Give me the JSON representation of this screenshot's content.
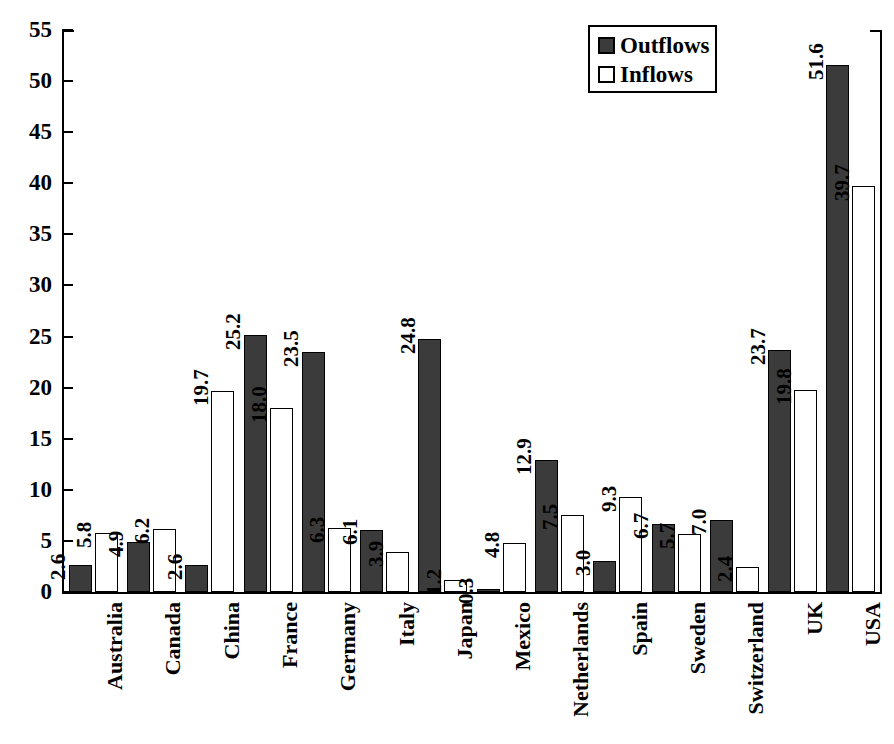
{
  "chart_data": {
    "type": "bar",
    "title": "",
    "subtitle": "",
    "xlabel": "",
    "ylabel": "",
    "ylim": [
      0,
      55
    ],
    "yticks": [
      0,
      5,
      10,
      15,
      20,
      25,
      30,
      35,
      40,
      45,
      50,
      55
    ],
    "ytick_labels": [
      "0",
      "5",
      "10",
      "15",
      "20",
      "25",
      "30",
      "35",
      "40",
      "45",
      "50",
      "55"
    ],
    "grid": false,
    "legend_position": "top-right",
    "categories": [
      "Australia",
      "Canada",
      "China",
      "France",
      "Germany",
      "Italy",
      "Japan",
      "Mexico",
      "Netherlands",
      "Spain",
      "Sweden",
      "Switzerland",
      "UK",
      "USA"
    ],
    "series": [
      {
        "name": "Outflows",
        "color": "#3b3b3b",
        "values": [
          2.6,
          4.9,
          2.6,
          25.2,
          23.5,
          6.1,
          24.8,
          0.3,
          12.9,
          3.0,
          6.7,
          7.0,
          23.7,
          51.6
        ],
        "labels": [
          "2.6",
          "4.9",
          "2.6",
          "25.2",
          "23.5",
          "6.1",
          "24.8",
          "0.3",
          "12.9",
          "3.0",
          "6.7",
          "7.0",
          "23.7",
          "51.6"
        ]
      },
      {
        "name": "Inflows",
        "color": "#ffffff",
        "values": [
          5.8,
          6.2,
          19.7,
          18.0,
          6.3,
          3.9,
          1.2,
          4.8,
          7.5,
          9.3,
          5.7,
          2.4,
          19.8,
          39.7
        ],
        "labels": [
          "5.8",
          "6.2",
          "19.7",
          "18.0",
          "6.3",
          "3.9",
          "1.2",
          "4.8",
          "7.5",
          "9.3",
          "5.7",
          "2.4",
          "19.8",
          "39.7"
        ]
      }
    ]
  },
  "legend": {
    "items": [
      {
        "label": "Outflows",
        "swatch": "outflow"
      },
      {
        "label": "Inflows",
        "swatch": "inflow"
      }
    ]
  },
  "colors": {
    "outflow_fill": "#3b3b3b",
    "inflow_fill": "#ffffff",
    "axis": "#000000",
    "background": "#ffffff"
  }
}
